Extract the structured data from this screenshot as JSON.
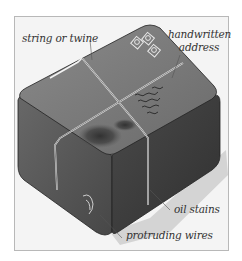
{
  "figure": {
    "colors": {
      "background": "#ffffff",
      "frame_fill": "#f4f4f4",
      "frame_border": "#b8b8b8",
      "box_top": "#7a7a7a",
      "box_left": "#5c5c5c",
      "box_right": "#3e3e3e",
      "stain": "#3a3a3a",
      "shadow": "#d2d2d2",
      "string": "#f2f2f2",
      "text": "#333333"
    },
    "labels": {
      "string": "string or twine",
      "address_line1": "handwritten",
      "address_line2": "address",
      "oil": "oil stains",
      "wires": "protruding wires"
    },
    "stamps_count": 3
  }
}
